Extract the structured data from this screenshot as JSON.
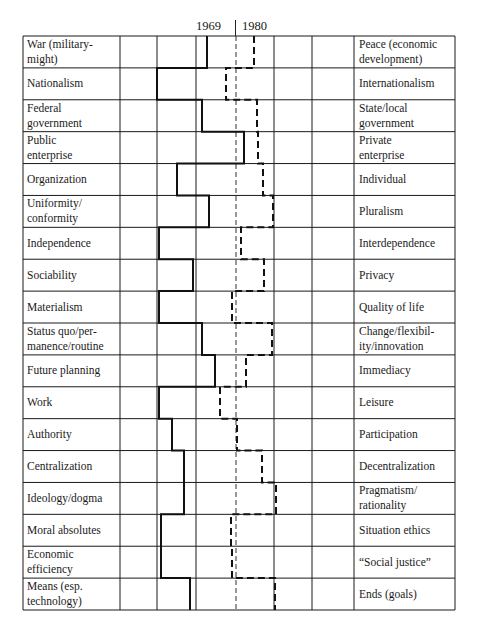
{
  "header": {
    "year_1969": "1969",
    "year_1980": "1980"
  },
  "chart_data": {
    "type": "profile",
    "title": "",
    "legend": [
      {
        "name": "1969",
        "style": "solid"
      },
      {
        "name": "1980",
        "style": "dashed"
      }
    ],
    "scale_columns": 6,
    "center_reference": "dashed vertical line at scale midpoint",
    "rows": [
      {
        "left": "War (military-might)",
        "right": "Peace (economic development)",
        "v1969": 2.25,
        "v1980": 3.45
      },
      {
        "left": "Nationalism",
        "right": "Internationalism",
        "v1969": 0.95,
        "v1980": 2.7
      },
      {
        "left": "Federal government",
        "right": "State/local government",
        "v1969": 2.1,
        "v1980": 3.5
      },
      {
        "left": "Public enterprise",
        "right": "Private enterprise",
        "v1969": 3.2,
        "v1980": 3.55
      },
      {
        "left": "Organization",
        "right": "Individual",
        "v1969": 1.45,
        "v1980": 3.65
      },
      {
        "left": "Uniformity/conformity",
        "right": "Pluralism",
        "v1969": 2.3,
        "v1980": 3.9
      },
      {
        "left": "Independence",
        "right": "Interdependence",
        "v1969": 1.0,
        "v1980": 3.1
      },
      {
        "left": "Sociability",
        "right": "Privacy",
        "v1969": 1.9,
        "v1980": 3.7
      },
      {
        "left": "Materialism",
        "right": "Quality of life",
        "v1969": 1.0,
        "v1980": 2.85
      },
      {
        "left": "Status quo/permanence/routine",
        "right": "Change/flexibility/innovation",
        "v1969": 2.1,
        "v1980": 3.9
      },
      {
        "left": "Future planning",
        "right": "Immediacy",
        "v1969": 2.45,
        "v1980": 3.25
      },
      {
        "left": "Work",
        "right": "Leisure",
        "v1969": 1.0,
        "v1980": 2.55
      },
      {
        "left": "Authority",
        "right": "Participation",
        "v1969": 1.35,
        "v1980": 3.0
      },
      {
        "left": "Centralization",
        "right": "Decentralization",
        "v1969": 1.65,
        "v1980": 3.65
      },
      {
        "left": "Ideology/dogma",
        "right": "Pragmatism/rationality",
        "v1969": 1.65,
        "v1980": 4.0
      },
      {
        "left": "Moral absolutes",
        "right": "Situation ethics",
        "v1969": 1.05,
        "v1980": 2.85
      },
      {
        "left": "Economic efficiency",
        "right": "“Social justice”",
        "v1969": 1.05,
        "v1980": 2.85
      },
      {
        "left": "Means (esp. technology)",
        "right": "Ends (goals)",
        "v1969": 1.8,
        "v1980": 3.95
      }
    ]
  },
  "left_labels": [
    [
      "War (military-",
      "might)"
    ],
    [
      "Nationalism"
    ],
    [
      "Federal",
      "government"
    ],
    [
      "Public",
      "enterprise"
    ],
    [
      "Organization"
    ],
    [
      "Uniformity/",
      "conformity"
    ],
    [
      "Independence"
    ],
    [
      "Sociability"
    ],
    [
      "Materialism"
    ],
    [
      "Status quo/per-",
      "manence/routine"
    ],
    [
      "Future planning"
    ],
    [
      "Work"
    ],
    [
      "Authority"
    ],
    [
      "Centralization"
    ],
    [
      "Ideology/dogma"
    ],
    [
      "Moral absolutes"
    ],
    [
      "Economic",
      "efficiency"
    ],
    [
      "Means (esp.",
      "technology)"
    ]
  ],
  "right_labels": [
    [
      "Peace (economic",
      "development)"
    ],
    [
      "Internationalism"
    ],
    [
      "State/local",
      "government"
    ],
    [
      "Private",
      "enterprise"
    ],
    [
      "Individual"
    ],
    [
      "Pluralism"
    ],
    [
      "Interdependence"
    ],
    [
      "Privacy"
    ],
    [
      "Quality of life"
    ],
    [
      "Change/flexibil-",
      "ity/innovation"
    ],
    [
      "Immediacy"
    ],
    [
      "Leisure"
    ],
    [
      "Participation"
    ],
    [
      "Decentralization"
    ],
    [
      "Pragmatism/",
      "rationality"
    ],
    [
      "Situation ethics"
    ],
    [
      "“Social justice”"
    ],
    [
      "Ends (goals)"
    ]
  ],
  "profile_x": {
    "solid_1969": [
      207,
      157,
      202,
      244,
      177,
      209,
      159,
      193,
      159,
      202,
      215,
      159,
      172,
      184,
      184,
      161,
      161,
      190
    ],
    "dashed_1980": [
      254,
      226,
      257,
      258,
      263,
      273,
      241,
      264,
      232,
      272,
      246,
      220,
      237,
      262,
      276,
      231,
      232,
      275
    ]
  }
}
